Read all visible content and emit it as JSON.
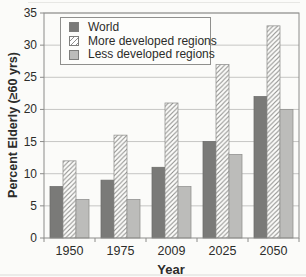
{
  "figure": {
    "background": "#fbfbf9",
    "grid_color": "#c6c6c4",
    "axis_color": "#8c8c8a",
    "text_color": "#2c2c2a",
    "world_fill": "#7a7a78",
    "less_fill": "#bcbcba",
    "hatch_line_color": "#8f8f8d"
  },
  "chart_data": {
    "type": "bar",
    "title": "",
    "xlabel": "Year",
    "ylabel": "Percent Elderly (≥60 yrs)",
    "categories": [
      "1950",
      "1975",
      "2009",
      "2025",
      "2050"
    ],
    "series": [
      {
        "name": "World",
        "values": [
          8,
          9,
          11,
          15,
          22
        ],
        "pattern": "solid-dark"
      },
      {
        "name": "More developed regions",
        "values": [
          12,
          16,
          21,
          27,
          33
        ],
        "pattern": "diagonal-hatch"
      },
      {
        "name": "Less developed regions",
        "values": [
          6,
          6,
          8,
          13,
          20
        ],
        "pattern": "solid-light"
      }
    ],
    "ylim": [
      0,
      35
    ],
    "ytick_step": 5,
    "yticks": [
      0,
      5,
      10,
      15,
      20,
      25,
      30,
      35
    ],
    "grid": "horizontal",
    "legend_position": "top-left"
  }
}
